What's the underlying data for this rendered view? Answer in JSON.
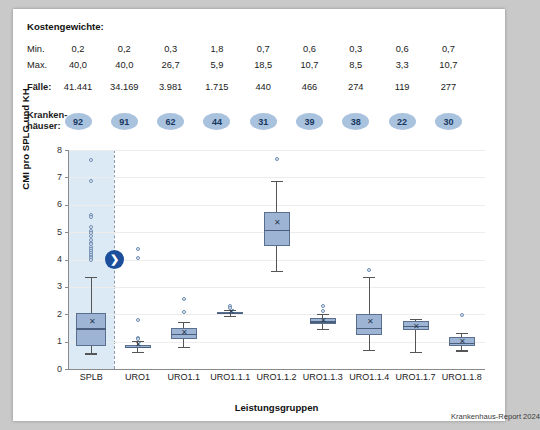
{
  "header": {
    "title": "Kostengewichte:",
    "rows": [
      {
        "label": "Min.",
        "bold": false,
        "values": [
          "0,2",
          "0,2",
          "0,3",
          "1,8",
          "0,7",
          "0,6",
          "0,3",
          "0,6",
          "0,7"
        ]
      },
      {
        "label": "Max.",
        "bold": false,
        "values": [
          "40,0",
          "40,0",
          "26,7",
          "5,9",
          "18,5",
          "10,7",
          "8,5",
          "3,3",
          "10,7"
        ]
      },
      {
        "label": "Fälle:",
        "bold": true,
        "values": [
          "41.441",
          "34.169",
          "3.981",
          "1.715",
          "440",
          "466",
          "274",
          "119",
          "277"
        ]
      }
    ],
    "hospitals_label": "Kranken-\nhäuser:",
    "hospitals": [
      "92",
      "91",
      "62",
      "44",
      "31",
      "39",
      "38",
      "22",
      "30"
    ],
    "circle_color": "#a9c2de",
    "circle_text_color": "#17375e"
  },
  "marker": {
    "glyph": "❯",
    "value": 4.0,
    "color": "#1b4f9c"
  },
  "credit": "Krankenhaus-Report 2024",
  "chart_data": {
    "type": "box",
    "title": "",
    "xlabel": "Leistungsgruppen",
    "ylabel": "CMI pro SPLG und KH",
    "ylim": [
      0,
      8
    ],
    "yticks": [
      0,
      1,
      2,
      3,
      4,
      5,
      6,
      7,
      8
    ],
    "ytick_labels": [
      "0",
      "1",
      "2",
      "3",
      "4",
      "5",
      "6",
      "7",
      "8"
    ],
    "grid": true,
    "legend": "none",
    "highlight_band": {
      "category": "SPLB",
      "color": "#dceaf6"
    },
    "categories": [
      "SPLB",
      "URO1",
      "URO1.1",
      "URO1.1.1",
      "URO1.1.2",
      "URO1.1.3",
      "URO1.1.4",
      "URO1.1.7",
      "URO1.1.8"
    ],
    "boxes": [
      {
        "category": "SPLB",
        "whisker_low": 0.57,
        "q1": 0.85,
        "median": 1.48,
        "q3": 2.03,
        "whisker_high": 3.35,
        "mean": 1.72,
        "outliers": [
          7.65,
          6.88,
          5.62,
          5.55,
          5.18,
          5.05,
          4.95,
          4.85,
          4.72,
          4.62,
          4.55,
          4.45,
          4.38,
          4.3,
          4.22,
          4.15,
          4.1,
          4.05,
          4.0
        ]
      },
      {
        "category": "URO1",
        "whisker_low": 0.62,
        "q1": 0.76,
        "median": 0.8,
        "q3": 0.86,
        "whisker_high": 1.02,
        "mean": 0.86,
        "outliers": [
          4.4,
          4.05,
          1.8,
          1.12,
          1.08
        ]
      },
      {
        "category": "URO1.1",
        "whisker_low": 0.82,
        "q1": 1.1,
        "median": 1.28,
        "q3": 1.48,
        "whisker_high": 1.72,
        "mean": 1.32,
        "outliers": [
          2.55,
          2.1
        ]
      },
      {
        "category": "URO1.1.1",
        "whisker_low": 1.95,
        "q1": 2.02,
        "median": 2.06,
        "q3": 2.1,
        "whisker_high": 2.16,
        "mean": 2.07,
        "outliers": [
          2.3,
          2.22
        ]
      },
      {
        "category": "URO1.1.2",
        "whisker_low": 3.58,
        "q1": 4.5,
        "median": 5.08,
        "q3": 5.72,
        "whisker_high": 6.88,
        "mean": 5.35,
        "outliers": [
          7.68
        ]
      },
      {
        "category": "URO1.1.3",
        "whisker_low": 1.45,
        "q1": 1.65,
        "median": 1.74,
        "q3": 1.86,
        "whisker_high": 2.02,
        "mean": 1.76,
        "outliers": [
          2.3,
          2.12
        ]
      },
      {
        "category": "URO1.1.4",
        "whisker_low": 0.7,
        "q1": 1.26,
        "median": 1.5,
        "q3": 2.0,
        "whisker_high": 3.35,
        "mean": 1.72,
        "outliers": [
          3.62
        ]
      },
      {
        "category": "URO1.1.7",
        "whisker_low": 0.62,
        "q1": 1.42,
        "median": 1.58,
        "q3": 1.76,
        "whisker_high": 1.82,
        "mean": 1.55,
        "outliers": []
      },
      {
        "category": "URO1.1.8",
        "whisker_low": 0.68,
        "q1": 0.85,
        "median": 0.96,
        "q3": 1.16,
        "whisker_high": 1.32,
        "mean": 1.0,
        "outliers": [
          1.98
        ]
      }
    ]
  }
}
